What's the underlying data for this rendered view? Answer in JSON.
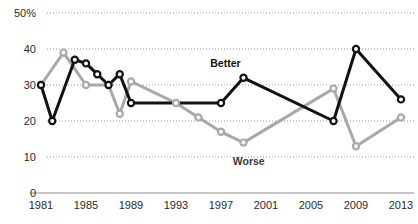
{
  "chart_data": {
    "type": "line",
    "title": "",
    "subtitle": "",
    "xlabel": "",
    "ylabel": "",
    "x": [
      1981,
      1982,
      1983,
      1984,
      1985,
      1986,
      1987,
      1988,
      1989,
      1991,
      1993,
      1995,
      1997,
      1999,
      2001,
      2005,
      2007,
      2009,
      2013
    ],
    "xlim": [
      1981,
      2013
    ],
    "ylim": [
      0,
      50
    ],
    "yticks": [
      0,
      10,
      20,
      30,
      40,
      50
    ],
    "ytick_labels": [
      "0",
      "10",
      "20",
      "30",
      "40",
      "50%"
    ],
    "xticks": [
      1981,
      1985,
      1989,
      1993,
      1997,
      2001,
      2005,
      2009,
      2013
    ],
    "xtick_labels": [
      "1981",
      "1985",
      "1989",
      "1993",
      "1997",
      "2001",
      "2005",
      "2009",
      "2013"
    ],
    "grid": true,
    "grid_style": "dotted-horizontal",
    "legend": "inline-annotations",
    "series": [
      {
        "name": "Better",
        "color": "#121212",
        "marker": "circle-open",
        "points": [
          {
            "x": 1981,
            "y": 30
          },
          {
            "x": 1982,
            "y": 20
          },
          {
            "x": 1984,
            "y": 37
          },
          {
            "x": 1985,
            "y": 36
          },
          {
            "x": 1986,
            "y": 33
          },
          {
            "x": 1987,
            "y": 30
          },
          {
            "x": 1988,
            "y": 33
          },
          {
            "x": 1989,
            "y": 25
          },
          {
            "x": 1997,
            "y": 25
          },
          {
            "x": 1999,
            "y": 32
          },
          {
            "x": 2007,
            "y": 20
          },
          {
            "x": 2009,
            "y": 40
          },
          {
            "x": 2013,
            "y": 26
          }
        ]
      },
      {
        "name": "Worse",
        "color": "#a9a9a9",
        "marker": "circle-open",
        "points": [
          {
            "x": 1981,
            "y": 30
          },
          {
            "x": 1983,
            "y": 39
          },
          {
            "x": 1985,
            "y": 30
          },
          {
            "x": 1987,
            "y": 30
          },
          {
            "x": 1988,
            "y": 22
          },
          {
            "x": 1989,
            "y": 31
          },
          {
            "x": 1993,
            "y": 25
          },
          {
            "x": 1995,
            "y": 21
          },
          {
            "x": 1997,
            "y": 17
          },
          {
            "x": 1999,
            "y": 14
          },
          {
            "x": 2007,
            "y": 29
          },
          {
            "x": 2009,
            "y": 13
          },
          {
            "x": 2013,
            "y": 21
          }
        ]
      }
    ],
    "annotations": [
      {
        "text": "Better",
        "x": 1998,
        "y": 36,
        "color": "#121212"
      },
      {
        "text": "Worse",
        "x": 2000,
        "y": 9,
        "color": "#3a3a3a"
      }
    ]
  }
}
